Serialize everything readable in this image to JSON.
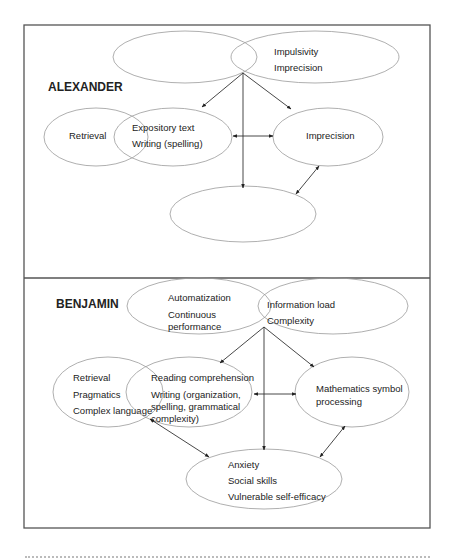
{
  "panels": [
    {
      "id": "alexander",
      "title": "ALEXANDER",
      "title_pos": [
        48,
        91
      ],
      "ellipses": [
        {
          "name": "top-left-ellipse",
          "cx": 185,
          "cy": 57,
          "rx": 72,
          "ry": 26,
          "lines": []
        },
        {
          "name": "top-right-ellipse",
          "cx": 315,
          "cy": 57,
          "rx": 84,
          "ry": 26,
          "lines": [
            {
              "text": "Impulsivity",
              "x": 274,
              "y": 55
            },
            {
              "text": "Imprecision",
              "x": 274,
              "y": 71
            }
          ]
        },
        {
          "name": "retrieval-ellipse",
          "cx": 96,
          "cy": 137,
          "rx": 52,
          "ry": 29,
          "lines": [
            {
              "text": "Retrieval",
              "x": 69,
              "y": 139
            }
          ]
        },
        {
          "name": "expository-ellipse",
          "cx": 173,
          "cy": 137,
          "rx": 59,
          "ry": 29,
          "lines": [
            {
              "text": "Expository text",
              "x": 132,
              "y": 131
            },
            {
              "text": "Writing (spelling)",
              "x": 132,
              "y": 147
            }
          ]
        },
        {
          "name": "imprecision-ellipse",
          "cx": 328,
          "cy": 137,
          "rx": 55,
          "ry": 29,
          "lines": [
            {
              "text": "Imprecision",
              "x": 306,
              "y": 139
            }
          ]
        },
        {
          "name": "bottom-empty-ellipse",
          "cx": 243,
          "cy": 214,
          "rx": 73,
          "ry": 28,
          "lines": []
        }
      ],
      "arrows": [
        {
          "x1": 243,
          "y1": 73,
          "x2": 202,
          "y2": 107,
          "heads": "end"
        },
        {
          "x1": 243,
          "y1": 73,
          "x2": 291,
          "y2": 109,
          "heads": "end"
        },
        {
          "x1": 243,
          "y1": 73,
          "x2": 243,
          "y2": 188,
          "heads": "end"
        },
        {
          "x1": 233,
          "y1": 136,
          "x2": 273,
          "y2": 136,
          "heads": "both"
        },
        {
          "x1": 319,
          "y1": 166,
          "x2": 296,
          "y2": 194,
          "heads": "both"
        }
      ]
    },
    {
      "id": "benjamin",
      "title": "BENJAMIN",
      "title_pos": [
        56,
        308
      ],
      "ellipses": [
        {
          "name": "automatization-ellipse",
          "cx": 199,
          "cy": 306,
          "rx": 72,
          "ry": 28,
          "lines": [
            {
              "text": "Automatization",
              "x": 168,
              "y": 301
            },
            {
              "text": "Continuous",
              "x": 168,
              "y": 318
            },
            {
              "text": "performance",
              "x": 168,
              "y": 330
            }
          ]
        },
        {
          "name": "information-load-ellipse",
          "cx": 333,
          "cy": 306,
          "rx": 75,
          "ry": 28,
          "lines": [
            {
              "text": "Information load",
              "x": 267,
              "y": 308
            },
            {
              "text": "Complexity",
              "x": 267,
              "y": 324
            }
          ]
        },
        {
          "name": "retrieval-pragmatics-ellipse",
          "cx": 108,
          "cy": 392,
          "rx": 55,
          "ry": 35,
          "lines": [
            {
              "text": "Retrieval",
              "x": 73,
              "y": 381
            },
            {
              "text": "Pragmatics",
              "x": 73,
              "y": 398
            },
            {
              "text": "Complex language",
              "x": 73,
              "y": 414
            }
          ]
        },
        {
          "name": "reading-writing-ellipse",
          "cx": 189,
          "cy": 392,
          "rx": 63,
          "ry": 35,
          "lines": [
            {
              "text": "Reading comprehension",
              "x": 151,
              "y": 381
            },
            {
              "text": "Writing (organization,",
              "x": 151,
              "y": 398
            },
            {
              "text": "spelling, grammatical",
              "x": 151,
              "y": 410
            },
            {
              "text": "complexity)",
              "x": 151,
              "y": 422
            }
          ]
        },
        {
          "name": "mathematics-ellipse",
          "cx": 352,
          "cy": 392,
          "rx": 57,
          "ry": 35,
          "lines": [
            {
              "text": "Mathematics symbol",
              "x": 316,
              "y": 392
            },
            {
              "text": "processing",
              "x": 316,
              "y": 405
            }
          ]
        },
        {
          "name": "anxiety-ellipse",
          "cx": 264,
          "cy": 479,
          "rx": 78,
          "ry": 30,
          "lines": [
            {
              "text": "Anxiety",
              "x": 228,
              "y": 468
            },
            {
              "text": "Social skills",
              "x": 228,
              "y": 484
            },
            {
              "text": "Vulnerable self-efficacy",
              "x": 228,
              "y": 500
            }
          ]
        }
      ],
      "arrows": [
        {
          "x1": 264,
          "y1": 327,
          "x2": 220,
          "y2": 363,
          "heads": "end"
        },
        {
          "x1": 264,
          "y1": 327,
          "x2": 314,
          "y2": 367,
          "heads": "end"
        },
        {
          "x1": 264,
          "y1": 327,
          "x2": 264,
          "y2": 450,
          "heads": "end"
        },
        {
          "x1": 254,
          "y1": 394,
          "x2": 296,
          "y2": 394,
          "heads": "both"
        },
        {
          "x1": 150,
          "y1": 419,
          "x2": 209,
          "y2": 457,
          "heads": "both"
        },
        {
          "x1": 345,
          "y1": 426,
          "x2": 320,
          "y2": 457,
          "heads": "both"
        }
      ]
    }
  ],
  "frame": {
    "x": 24,
    "y": 25,
    "width": 406,
    "height": 503,
    "divider_y": 278
  },
  "colors": {
    "frame": "#555555",
    "ellipse": "#9a9a9a",
    "arrow": "#333333",
    "text": "#222222"
  }
}
